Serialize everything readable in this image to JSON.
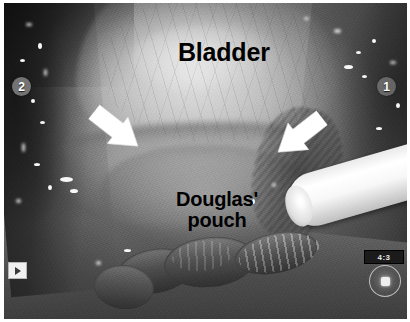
{
  "image": {
    "modality": "laparoscopic endoscopic still",
    "color_mode": "grayscale",
    "frame_border_color": "#ffffff",
    "width": 410,
    "height": 322
  },
  "annotations": {
    "bladder_label": "Bladder",
    "douglas_label": "Douglas'\npouch",
    "label_color": "#000000"
  },
  "arrows": [
    {
      "name": "left-arrow",
      "direction": "down-right",
      "color": "#ffffff"
    },
    {
      "name": "right-arrow",
      "direction": "down-left",
      "color": "#ffffff"
    }
  ],
  "port_markers": [
    {
      "id": "2",
      "position": "left"
    },
    {
      "id": "1",
      "position": "right"
    }
  ],
  "overlays": {
    "play_icon": "play-icon",
    "readout_value": "4:3",
    "gauge_icon": "dial-gauge-icon"
  },
  "anatomy": {
    "bladder": "Bladder",
    "douglas_pouch": "Douglas' pouch",
    "bowel": "sigmoid colon loops",
    "instrument": "suction irrigator"
  },
  "specular_highlights": [
    {
      "x": 22,
      "y": 20,
      "w": 6,
      "h": 3
    },
    {
      "x": 34,
      "y": 40,
      "w": 4,
      "h": 6
    },
    {
      "x": 16,
      "y": 56,
      "w": 5,
      "h": 3
    },
    {
      "x": 40,
      "y": 66,
      "w": 3,
      "h": 7
    },
    {
      "x": 27,
      "y": 96,
      "w": 4,
      "h": 4
    },
    {
      "x": 36,
      "y": 118,
      "w": 5,
      "h": 3
    },
    {
      "x": 18,
      "y": 140,
      "w": 3,
      "h": 9
    },
    {
      "x": 30,
      "y": 160,
      "w": 6,
      "h": 3
    },
    {
      "x": 44,
      "y": 182,
      "w": 4,
      "h": 5
    },
    {
      "x": 12,
      "y": 196,
      "w": 5,
      "h": 4
    },
    {
      "x": 56,
      "y": 174,
      "w": 13,
      "h": 5
    },
    {
      "x": 66,
      "y": 186,
      "w": 8,
      "h": 4
    },
    {
      "x": 330,
      "y": 26,
      "w": 7,
      "h": 4
    },
    {
      "x": 352,
      "y": 48,
      "w": 5,
      "h": 3
    },
    {
      "x": 368,
      "y": 36,
      "w": 4,
      "h": 4
    },
    {
      "x": 386,
      "y": 58,
      "w": 6,
      "h": 3
    },
    {
      "x": 340,
      "y": 62,
      "w": 9,
      "h": 4
    },
    {
      "x": 358,
      "y": 72,
      "w": 5,
      "h": 3
    },
    {
      "x": 300,
      "y": 14,
      "w": 5,
      "h": 3
    },
    {
      "x": 392,
      "y": 100,
      "w": 4,
      "h": 5
    },
    {
      "x": 372,
      "y": 124,
      "w": 6,
      "h": 3
    },
    {
      "x": 268,
      "y": 180,
      "w": 4,
      "h": 4
    },
    {
      "x": 248,
      "y": 196,
      "w": 3,
      "h": 5
    },
    {
      "x": 120,
      "y": 246,
      "w": 7,
      "h": 3
    },
    {
      "x": 92,
      "y": 258,
      "w": 5,
      "h": 4
    }
  ]
}
